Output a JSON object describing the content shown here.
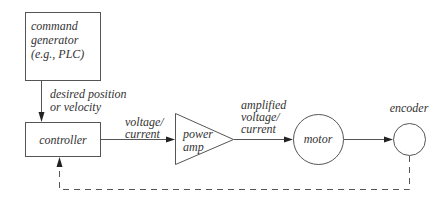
{
  "diagram": {
    "type": "block-diagram",
    "title": "",
    "nodes": {
      "command_generator": {
        "lines": [
          "command",
          "generator",
          "(e.g., PLC)"
        ],
        "shape": "rectangle"
      },
      "controller": {
        "label": "controller",
        "shape": "rectangle"
      },
      "power_amp": {
        "lines": [
          "power",
          "amp"
        ],
        "shape": "triangle"
      },
      "motor": {
        "label": "motor",
        "shape": "circle"
      },
      "encoder": {
        "label": "encoder",
        "shape": "circle"
      }
    },
    "edges": {
      "cmd_to_controller": {
        "lines": [
          "desired position",
          "or velocity"
        ],
        "style": "solid"
      },
      "controller_to_amp": {
        "lines": [
          "voltage/",
          "current"
        ],
        "style": "solid"
      },
      "amp_to_motor": {
        "lines": [
          "amplified",
          "voltage/",
          "current"
        ],
        "style": "solid"
      },
      "motor_to_encoder": {
        "style": "solid"
      },
      "encoder_to_controller": {
        "style": "dashed",
        "meaning": "feedback"
      }
    },
    "colors": {
      "stroke": "#555555",
      "arrow": "#222222",
      "text": "#333333",
      "background": "#ffffff"
    }
  }
}
